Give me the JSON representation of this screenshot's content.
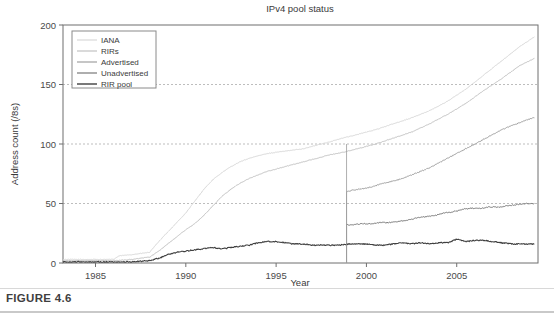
{
  "figure": {
    "caption": "FIGURE 4.6"
  },
  "chart_data": {
    "type": "line",
    "title": "IPv4 pool status",
    "xlabel": "Year",
    "ylabel": "Address count (/8s)",
    "xlim": [
      1983.2,
      2009.5
    ],
    "ylim": [
      0,
      200
    ],
    "xticks": [
      1985,
      1990,
      1995,
      2000,
      2005
    ],
    "xticklabels": [
      "1985",
      "1990",
      "1995",
      "2000",
      "2005"
    ],
    "yticks": [
      0,
      50,
      100,
      150,
      200
    ],
    "yticklabels": [
      "0",
      "50",
      "100",
      "150",
      "200"
    ],
    "grid": "horizontal-dashed-at-50-100-150",
    "legend_position": "top-left-inside",
    "colors": {
      "iana": "#d8d8d8",
      "rirs": "#c2c2c2",
      "advertised": "#a0a0a0",
      "unadvertised": "#787878",
      "rir_pool": "#404040",
      "axis": "#6f6f6f",
      "grid": "#bdbdbd",
      "text": "#3a3a3a"
    },
    "series": [
      {
        "name": "IANA",
        "color": "#d8d8d8",
        "x": [
          1983.2,
          1984,
          1985,
          1986,
          1986.3,
          1987,
          1987.5,
          1988,
          1988.5,
          1989,
          1989.5,
          1990,
          1990.5,
          1991,
          1991.5,
          1992,
          1992.5,
          1993,
          1993.5,
          1994,
          1994.5,
          1995,
          1995.5,
          1996,
          1996.5,
          1997,
          1997.5,
          1998,
          1998.7,
          1999.5,
          2000.5,
          2001.5,
          2002.5,
          2003.5,
          2004.5,
          2005.5,
          2006.5,
          2007.5,
          2008.5,
          2009.3
        ],
        "y": [
          3,
          3,
          3,
          3,
          6,
          7,
          8,
          9,
          18,
          26,
          34,
          42,
          52,
          62,
          70,
          76,
          81,
          85,
          88,
          90,
          92,
          93,
          94,
          95,
          96,
          98,
          100,
          102,
          105,
          108,
          112,
          117,
          122,
          128,
          136,
          146,
          158,
          170,
          182,
          190
        ]
      },
      {
        "name": "RIRs",
        "color": "#c2c2c2",
        "x": [
          1983.2,
          1985,
          1986,
          1987,
          1988,
          1988.5,
          1989,
          1989.5,
          1990,
          1990.5,
          1991,
          1991.5,
          1992,
          1992.5,
          1993,
          1993.5,
          1994,
          1994.5,
          1995,
          1995.5,
          1996,
          1996.5,
          1997,
          1997.5,
          1998,
          1998.7,
          1999.5,
          2000.5,
          2001.5,
          2002.5,
          2003.5,
          2004.5,
          2005.5,
          2006.5,
          2007.5,
          2008.5,
          2009.3
        ],
        "y": [
          2,
          2,
          2,
          3,
          5,
          10,
          16,
          22,
          28,
          33,
          40,
          48,
          56,
          62,
          67,
          71,
          74,
          77,
          79,
          81,
          83,
          85,
          87,
          89,
          91,
          93,
          96,
          100,
          105,
          110,
          117,
          125,
          134,
          145,
          155,
          166,
          172
        ]
      },
      {
        "name": "Advertised",
        "color": "#a0a0a0",
        "x": [
          1998.9,
          1999.2,
          1999.6,
          2000,
          2000.5,
          2001,
          2001.5,
          2002,
          2002.5,
          2003,
          2003.5,
          2004,
          2004.5,
          2005,
          2005.5,
          2006,
          2006.5,
          2007,
          2007.5,
          2008,
          2008.5,
          2009,
          2009.3
        ],
        "y": [
          60,
          61,
          62,
          63,
          65,
          67,
          69,
          71,
          74,
          77,
          80,
          84,
          88,
          92,
          96,
          100,
          104,
          108,
          112,
          115,
          118,
          121,
          122
        ]
      },
      {
        "name": "Unadvertised",
        "color": "#787878",
        "x": [
          1998.9,
          1999.3,
          1999.8,
          2000.3,
          2000.8,
          2001.3,
          2001.8,
          2002.3,
          2002.8,
          2003.3,
          2003.8,
          2004.3,
          2004.8,
          2005.3,
          2005.8,
          2006.3,
          2006.8,
          2007.3,
          2007.8,
          2008.3,
          2008.8,
          2009.3
        ],
        "y": [
          32,
          32,
          33,
          33,
          34,
          34,
          35,
          36,
          38,
          39,
          40,
          42,
          43,
          45,
          46,
          46,
          47,
          47,
          48,
          49,
          50,
          50
        ]
      },
      {
        "name": "RIR pool",
        "color": "#404040",
        "x": [
          1983.2,
          1986,
          1987,
          1988,
          1988.5,
          1989,
          1989.5,
          1990,
          1990.5,
          1991,
          1991.5,
          1992,
          1992.5,
          1993,
          1993.5,
          1994,
          1994.5,
          1995,
          1995.5,
          1996,
          1996.5,
          1997,
          1997.5,
          1998,
          1998.5,
          1999,
          1999.5,
          2000,
          2000.5,
          2001,
          2001.5,
          2002,
          2002.5,
          2003,
          2003.5,
          2004,
          2004.5,
          2005,
          2005.5,
          2006,
          2006.5,
          2007,
          2007.5,
          2008,
          2008.5,
          2009,
          2009.3
        ],
        "y": [
          1,
          1,
          1,
          2,
          4,
          7,
          9,
          10,
          11,
          12,
          13,
          12,
          13,
          14,
          15,
          17,
          18,
          18,
          17,
          16,
          16,
          15,
          15,
          15,
          15,
          16,
          16,
          16,
          15,
          15,
          16,
          17,
          16,
          17,
          16,
          17,
          17,
          20,
          18,
          19,
          19,
          18,
          17,
          16,
          16,
          16,
          16
        ]
      }
    ]
  },
  "legend": {
    "items": [
      {
        "label": "IANA"
      },
      {
        "label": "RIRs"
      },
      {
        "label": "Advertised"
      },
      {
        "label": "Unadvertised"
      },
      {
        "label": "RIR pool"
      }
    ]
  }
}
